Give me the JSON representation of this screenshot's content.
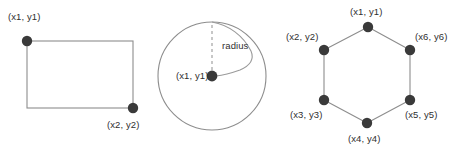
{
  "figure": {
    "background_color": "#ffffff",
    "stroke_color": "#8d8d8d",
    "dot_color": "#3a3a3a",
    "text_color": "#2f2f2f",
    "panels": [
      {
        "name": "rectangle",
        "shape": "rectangle",
        "labels": [
          {
            "id": "rect-p1",
            "text": "(x1, y1)",
            "x": 8,
            "y": 12
          },
          {
            "id": "rect-p2",
            "text": "(x2, y2)",
            "x": 107,
            "y": 120
          }
        ],
        "points": [
          {
            "id": "rect-dot-1",
            "cx": 27,
            "cy": 41
          },
          {
            "id": "rect-dot-2",
            "cx": 133,
            "cy": 108
          }
        ],
        "geometry": {
          "x": 27,
          "y": 41,
          "width": 106,
          "height": 67
        }
      },
      {
        "name": "circle",
        "shape": "circle",
        "labels": [
          {
            "id": "circle-center",
            "text": "(x1, y1)",
            "x": 176,
            "y": 71
          },
          {
            "id": "circle-radius",
            "text": "radius",
            "x": 222,
            "y": 41
          }
        ],
        "points": [
          {
            "id": "circle-dot-center",
            "cx": 212,
            "cy": 76
          }
        ],
        "geometry": {
          "cx": 212,
          "cy": 76,
          "r": 54
        }
      },
      {
        "name": "hexagon",
        "shape": "hexagon",
        "labels": [
          {
            "id": "hex-p1",
            "text": "(x1, y1)",
            "x": 350,
            "y": 7
          },
          {
            "id": "hex-p2",
            "text": "(x2, y2)",
            "x": 286,
            "y": 32
          },
          {
            "id": "hex-p3",
            "text": "(x3, y3)",
            "x": 290,
            "y": 110
          },
          {
            "id": "hex-p4",
            "text": "(x4, y4)",
            "x": 348,
            "y": 134
          },
          {
            "id": "hex-p5",
            "text": "(x5, y5)",
            "x": 405,
            "y": 110
          },
          {
            "id": "hex-p6",
            "text": "(x6, y6)",
            "x": 415,
            "y": 32
          }
        ],
        "points": [
          {
            "id": "hex-dot-1",
            "cx": 368,
            "cy": 27
          },
          {
            "id": "hex-dot-2",
            "cx": 324,
            "cy": 50
          },
          {
            "id": "hex-dot-3",
            "cx": 324,
            "cy": 100
          },
          {
            "id": "hex-dot-4",
            "cx": 367,
            "cy": 123
          },
          {
            "id": "hex-dot-5",
            "cx": 410,
            "cy": 100
          },
          {
            "id": "hex-dot-6",
            "cx": 410,
            "cy": 50
          }
        ],
        "geometry": {
          "vertices": "368,27 410,50 410,100 367,123 324,100 324,50"
        }
      }
    ]
  }
}
